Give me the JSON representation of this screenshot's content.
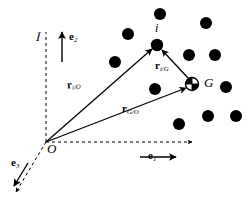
{
  "figure": {
    "background_color": "#ffffff",
    "ink_color": "#000000",
    "width": 250,
    "height": 203
  },
  "frame": {
    "label": "I",
    "label_description": "script-I inertial reference frame label",
    "origin_label": "O"
  },
  "axes": [
    {
      "name": "e1",
      "base": "e",
      "subscript": "1",
      "style": "dashed-guide-with-solid-arrow",
      "direction": "right"
    },
    {
      "name": "e2",
      "base": "e",
      "subscript": "2",
      "style": "dashed-guide-with-solid-arrow",
      "direction": "up"
    },
    {
      "name": "e3",
      "base": "e",
      "subscript": "3",
      "style": "dashed-guide-with-solid-arrow",
      "direction": "down-left"
    }
  ],
  "points": [
    {
      "id": "i",
      "label": "i",
      "x": 157,
      "y": 45,
      "marker": "filled-dot",
      "label_dx": 0,
      "label_dy": -16
    },
    {
      "id": "G",
      "label": "G",
      "x": 192,
      "y": 84,
      "marker": "quartered-circle",
      "label_dx": 12,
      "label_dy": -1
    },
    {
      "id": "O",
      "label": "O",
      "x": 46,
      "y": 142,
      "marker": "none",
      "label_dx": 2,
      "label_dy": 10
    }
  ],
  "vectors": [
    {
      "name": "r_i/O",
      "base": "r",
      "subscript": "i/O",
      "from": "O",
      "to": "i",
      "label_x": 76,
      "label_y": 82
    },
    {
      "name": "r_i/G",
      "base": "r",
      "subscript": "i/G",
      "from": "G",
      "to": "i",
      "label_x": 160,
      "label_y": 65
    },
    {
      "name": "r_G/O",
      "base": "r",
      "subscript": "G/O",
      "from": "O",
      "to": "G",
      "label_x": 131,
      "label_y": 107
    }
  ],
  "particles": [
    {
      "x": 160,
      "y": 14
    },
    {
      "x": 206,
      "y": 23
    },
    {
      "x": 128,
      "y": 34
    },
    {
      "x": 157,
      "y": 45
    },
    {
      "x": 189,
      "y": 55
    },
    {
      "x": 215,
      "y": 55
    },
    {
      "x": 115,
      "y": 62
    },
    {
      "x": 226,
      "y": 87
    },
    {
      "x": 155,
      "y": 89
    },
    {
      "x": 179,
      "y": 124
    },
    {
      "x": 208,
      "y": 116
    },
    {
      "x": 236,
      "y": 116
    }
  ],
  "marker_style": {
    "particle_radius": 6,
    "com_radius": 6.5,
    "com_description": "circle with two opposite quadrants filled"
  }
}
